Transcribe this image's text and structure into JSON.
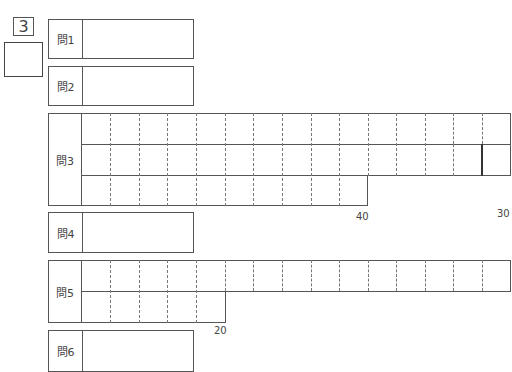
{
  "section": {
    "number": "3"
  },
  "score_box": {
    "value": ""
  },
  "questions": [
    {
      "label": "問1",
      "type": "box"
    },
    {
      "label": "問2",
      "type": "box"
    },
    {
      "label": "問3",
      "type": "grid",
      "rows": 3,
      "cols": 15,
      "last_row_cells": 10,
      "markers": [
        "30",
        "40"
      ]
    },
    {
      "label": "問4",
      "type": "box"
    },
    {
      "label": "問5",
      "type": "grid",
      "rows": 2,
      "cols": 15,
      "last_row_cells": 5,
      "markers": [
        "20"
      ]
    },
    {
      "label": "問6",
      "type": "box"
    }
  ]
}
